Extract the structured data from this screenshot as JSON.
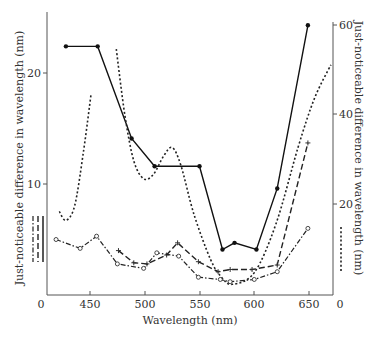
{
  "chart_data": {
    "type": "line",
    "title": "",
    "xlabel": "Wavelength (nm)",
    "ylabel_left": "Just-noticeable difference in wavelength (nm)",
    "ylabel_right": "Just-noticeable difference in wavelength (nm)",
    "xlim": [
      405,
      672
    ],
    "ylim_left": [
      0,
      25
    ],
    "ylim_right": [
      0,
      60
    ],
    "x_ticks": [
      450,
      500,
      550,
      600,
      650
    ],
    "x_tick_labels": [
      "450",
      "500",
      "550",
      "600",
      "650"
    ],
    "x_origin_label_left": "0",
    "x_origin_label_right": "0",
    "y_left_ticks": [
      10,
      20
    ],
    "y_left_tick_labels": [
      "10",
      "20"
    ],
    "y_right_ticks": [
      20,
      40,
      60
    ],
    "y_right_tick_labels": [
      "20",
      "40",
      "60"
    ],
    "grid": false,
    "legend": "line-style keys beside each axis: solid, dashed and dash-dot keyed to left axis; dotted keyed to right axis",
    "series": [
      {
        "name": "solid (filled dots)",
        "axis": "left",
        "style": "solid",
        "marker": "dot",
        "points": [
          [
            428,
            22.4
          ],
          [
            457,
            22.4
          ],
          [
            488,
            14.1
          ],
          [
            509,
            11.6
          ],
          [
            550,
            11.6
          ],
          [
            571,
            4.1
          ],
          [
            582,
            4.7
          ],
          [
            602,
            4.1
          ],
          [
            621,
            9.6
          ],
          [
            649,
            24.3
          ]
        ]
      },
      {
        "name": "dotted",
        "axis": "right",
        "style": "dotted",
        "marker": "none",
        "segments": [
          [
            [
              422,
              18.7
            ],
            [
              428,
              16.7
            ],
            [
              436,
              20
            ],
            [
              444,
              32
            ],
            [
              451,
              45
            ]
          ],
          [
            [
              474,
              55
            ],
            [
              482,
              40
            ],
            [
              490,
              30
            ],
            [
              499,
              26
            ],
            [
              508,
              27
            ],
            [
              517,
              31
            ],
            [
              525,
              33
            ],
            [
              533,
              29
            ],
            [
              545,
              18
            ],
            [
              560,
              8
            ],
            [
              570,
              4
            ],
            [
              580,
              2.4
            ],
            [
              600,
              5
            ],
            [
              620,
              16
            ],
            [
              640,
              33
            ],
            [
              655,
              44
            ],
            [
              670,
              51.5
            ]
          ]
        ]
      },
      {
        "name": "dashed (plus markers)",
        "axis": "left",
        "style": "dashed",
        "marker": "plus",
        "points": [
          [
            476,
            4.0
          ],
          [
            490,
            2.9
          ],
          [
            502,
            2.8
          ],
          [
            520,
            3.6
          ],
          [
            530,
            4.7
          ],
          [
            549,
            3.0
          ],
          [
            567,
            2.1
          ],
          [
            578,
            2.3
          ],
          [
            598,
            2.3
          ],
          [
            621,
            2.7
          ],
          [
            649,
            13.7
          ]
        ]
      },
      {
        "name": "dash-dot (open circles)",
        "axis": "left",
        "style": "dash-dot",
        "marker": "circle",
        "points": [
          [
            419,
            5.0
          ],
          [
            441,
            4.2
          ],
          [
            456,
            5.3
          ],
          [
            475,
            2.8
          ],
          [
            499,
            2.4
          ],
          [
            511,
            3.8
          ],
          [
            531,
            3.5
          ],
          [
            549,
            1.6
          ],
          [
            569,
            1.4
          ],
          [
            578,
            1.2
          ],
          [
            600,
            1.4
          ],
          [
            621,
            2.1
          ],
          [
            649,
            6.0
          ]
        ]
      }
    ]
  },
  "labels": {
    "xlabel": "Wavelength (nm)",
    "ylabel_left": "Just-noticeable difference in wavelength (nm)",
    "ylabel_right": "Just-noticeable difference in wavelength (nm)",
    "x_zero_left": "0",
    "x_zero_right": "0",
    "x_ticks": [
      "450",
      "500",
      "550",
      "600",
      "650"
    ],
    "y_left_ticks": [
      "10",
      "20"
    ],
    "y_right_ticks": [
      "20",
      "40",
      "60"
    ]
  }
}
